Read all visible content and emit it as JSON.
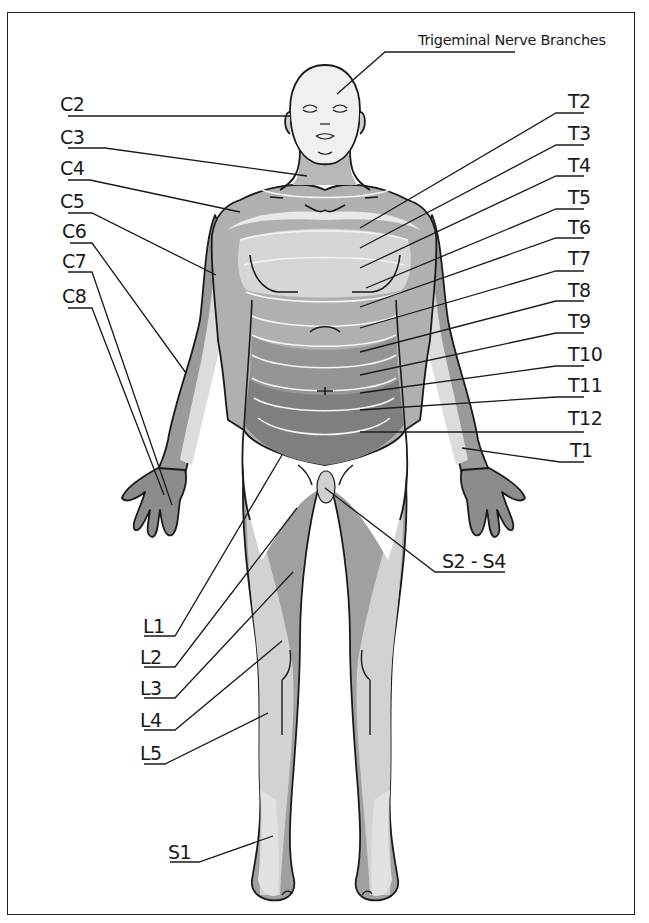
{
  "diagram": {
    "type": "dermatome-map",
    "view": "anterior",
    "colors": {
      "outline": "#1a1a1a",
      "head": "#f0f0f0",
      "c_band_dark": "#9a9a9a",
      "c_band_mid": "#b5b5b5",
      "c_band_light": "#dcdcdc",
      "t_upper": "#d6d6d6",
      "t_mid": "#a8a8a8",
      "t_lower": "#7f7f7f",
      "l_light": "#d2d2d2",
      "l_dark": "#9e9e9e",
      "s1": "#e2e2e2",
      "hand": "#8c8c8c",
      "background": "#ffffff"
    }
  },
  "labels": {
    "trigeminal": "Trigeminal Nerve Branches",
    "left": [
      "C2",
      "C3",
      "C4",
      "C5",
      "C6",
      "C7",
      "C8"
    ],
    "right": [
      "T2",
      "T3",
      "T4",
      "T5",
      "T6",
      "T7",
      "T8",
      "T9",
      "T10",
      "T11",
      "T12",
      "T1"
    ],
    "sacral": "S2 - S4",
    "lumbar": [
      "L1",
      "L2",
      "L3",
      "L4",
      "L5"
    ],
    "s1": "S1"
  }
}
